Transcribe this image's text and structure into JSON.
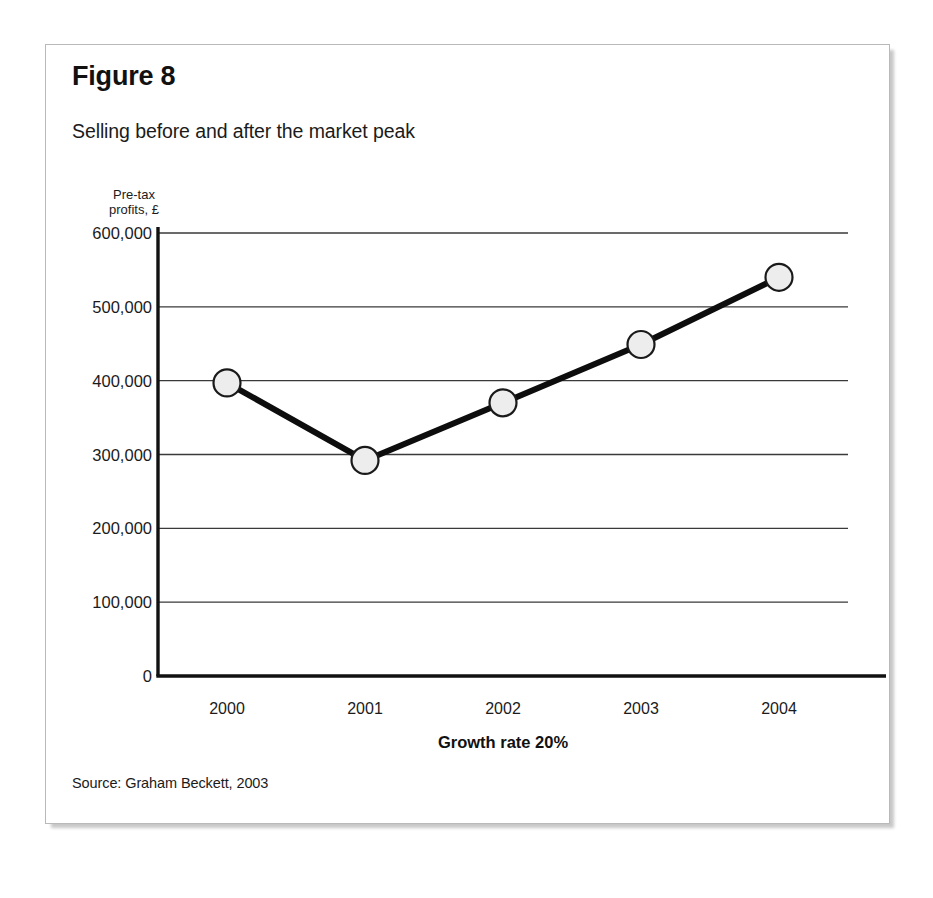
{
  "figure": {
    "title": "Figure 8",
    "subtitle": "Selling before and after the market peak",
    "source": "Source: Graham Beckett, 2003"
  },
  "chart_data": {
    "type": "line",
    "title": "Selling before and after the market peak",
    "xlabel": "Growth rate 20%",
    "ylabel": "Pre-tax\nprofits, £",
    "categories": [
      "2000",
      "2001",
      "2002",
      "2003",
      "2004"
    ],
    "values": [
      397000,
      292000,
      370000,
      449000,
      540000
    ],
    "ylim": [
      0,
      600000
    ],
    "ytick_labels": [
      "600,000",
      "500,000",
      "400,000",
      "300,000",
      "200,000",
      "100,000",
      "0"
    ],
    "ytick_values": [
      600000,
      500000,
      400000,
      300000,
      200000,
      100000,
      0
    ],
    "grid": true,
    "legend": false,
    "series": [
      {
        "name": "Pre-tax profits",
        "values": [
          397000,
          292000,
          370000,
          449000,
          540000
        ]
      }
    ],
    "marker": "circle",
    "marker_fill": "#ededed",
    "marker_stroke": "#1a1a1a",
    "line_color": "#0d0d0d",
    "grid_color": "#3a3a3a",
    "axis_color": "#111111"
  }
}
